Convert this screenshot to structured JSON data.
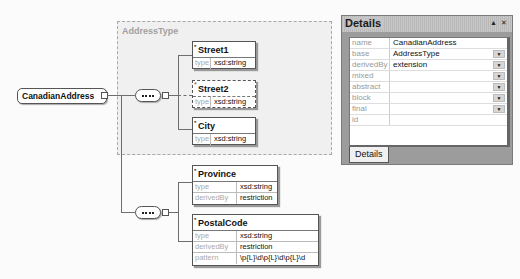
{
  "diagram": {
    "root": {
      "name": "CanadianAddress"
    },
    "group": {
      "label": "AddressType"
    },
    "sequence1": {
      "elements": [
        {
          "name": "Street1",
          "optional": false,
          "rows": [
            {
              "key": "type",
              "value": "xsd:string"
            }
          ]
        },
        {
          "name": "Street2",
          "optional": true,
          "rows": [
            {
              "key": "type",
              "value": "xsd:string"
            }
          ]
        },
        {
          "name": "City",
          "optional": false,
          "rows": [
            {
              "key": "type",
              "value": "xsd:string"
            }
          ]
        }
      ]
    },
    "sequence2": {
      "elements": [
        {
          "name": "Province",
          "rows": [
            {
              "key": "type",
              "value": "xsd:string"
            },
            {
              "key": "derivedBy",
              "value": "restriction"
            }
          ]
        },
        {
          "name": "PostalCode",
          "rows": [
            {
              "key": "type",
              "value": "xsd:string"
            },
            {
              "key": "derivedBy",
              "value": "restriction"
            },
            {
              "key": "pattern",
              "value": "\\p{L}\\d\\p{L}\\d\\p{L}\\d"
            }
          ]
        }
      ]
    }
  },
  "details": {
    "title": "Details",
    "pin_icon": "▲",
    "close_icon": "✕",
    "tab_label": "Details",
    "properties": [
      {
        "key": "name",
        "value": "CanadianAddress",
        "dropdown": false
      },
      {
        "key": "base",
        "value": "AddressType",
        "dropdown": true
      },
      {
        "key": "derivedBy",
        "value": "extension",
        "dropdown": true
      },
      {
        "key": "mixed",
        "value": "",
        "dropdown": true
      },
      {
        "key": "abstract",
        "value": "",
        "dropdown": true
      },
      {
        "key": "block",
        "value": "",
        "dropdown": true
      },
      {
        "key": "final",
        "value": "",
        "dropdown": true
      },
      {
        "key": "id",
        "value": "",
        "dropdown": false
      }
    ]
  }
}
